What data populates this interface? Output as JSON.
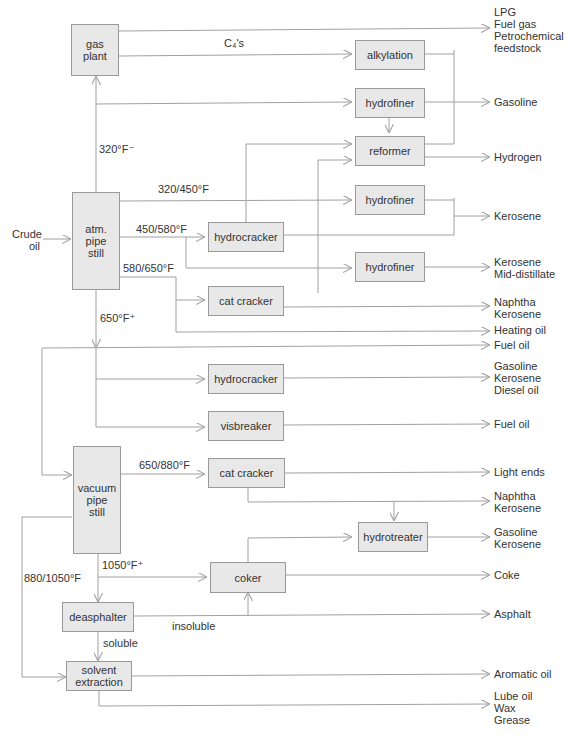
{
  "diagram": {
    "input": "Crude\noil",
    "units": {
      "gas_plant": "gas\nplant",
      "alkylation": "alkylation",
      "hydrofiner_1": "hydrofiner",
      "reformer": "reformer",
      "hydrofiner_2": "hydrofiner",
      "atm_pipe_still": "atm.\npipe\nstill",
      "hydrocracker_1": "hydrocracker",
      "hydrofiner_3": "hydrofiner",
      "cat_cracker_1": "cat cracker",
      "hydrocracker_2": "hydrocracker",
      "visbreaker": "visbreaker",
      "vacuum_pipe_still": "vacuum\npipe\nstill",
      "cat_cracker_2": "cat cracker",
      "hydrotreater": "hydrotreater",
      "coker": "coker",
      "deasphalter": "deasphalter",
      "solvent_extraction": "solvent\nextraction"
    },
    "stream_labels": {
      "c4s": "C₄'s",
      "f320minus": "320°F⁻",
      "f320_450": "320/450°F",
      "f450_580": "450/580°F",
      "f580_650": "580/650°F",
      "f650plus": "650°F⁺",
      "f650_880": "650/880°F",
      "f1050plus": "1050°F⁺",
      "f880_1050": "880/1050°F",
      "insoluble": "insoluble",
      "soluble": "soluble"
    },
    "products": {
      "lpg": "LPG\nFuel gas\nPetrochemical\nfeedstock",
      "gasoline": "Gasoline",
      "hydrogen": "Hydrogen",
      "kerosene": "Kerosene",
      "kerosene_mid": "Kerosene\nMid-distillate",
      "naphtha_kero_1": "Naphtha\nKerosene",
      "heating_oil": "Heating oil",
      "fuel_oil_1": "Fuel oil",
      "gas_kero_diesel": "Gasoline\nKerosene\nDiesel oil",
      "fuel_oil_2": "Fuel oil",
      "light_ends": "Light ends",
      "naphtha_kero_2": "Naphtha\nKerosene",
      "gas_kero": "Gasoline\nKerosene",
      "coke": "Coke",
      "asphalt": "Asphalt",
      "aromatic_oil": "Aromatic oil",
      "lube": "Lube oil\nWax\nGrease"
    },
    "colors": {
      "box_fill": "#e8e8e8",
      "box_border": "#9a9a9a",
      "line": "#a0a0a0",
      "text": "#333333"
    }
  }
}
